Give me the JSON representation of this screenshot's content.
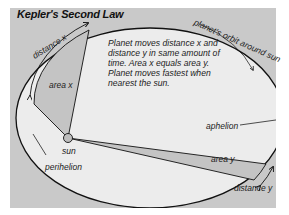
{
  "title": "Kepler's Second Law",
  "description": "Planet moves distance x and distance y in same amount of time. Area x equals area y. Planet moves fastest when nearest the sun.",
  "labels": {
    "orbit": "planet's orbit around sun",
    "distance_x": "distance x",
    "distance_y": "distance y",
    "area_x": "area x",
    "area_y": "area y",
    "sun": "sun",
    "perihelion": "perihelion",
    "aphelion": "aphelion"
  },
  "colors": {
    "background": "#ffffff",
    "panel": "#c9c9c9",
    "ellipse_fill": "#ececec",
    "wedge_fill": "#c4c4c4",
    "line": "#111111"
  }
}
